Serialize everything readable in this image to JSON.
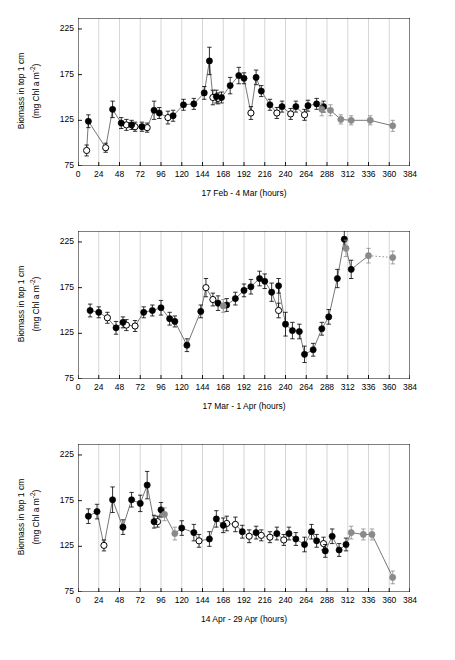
{
  "chart_data": [
    {
      "type": "scatter",
      "title": "",
      "xlabel": "17 Feb - 4 Mar  (hours)",
      "ylabel": "Biomass in top 1 cm (mg Chl a m-2)",
      "ylabel_line1": "Biomass in top 1 cm",
      "ylabel_line2": "(mg Chl a m",
      "ylabel_exp": "-2",
      "ylabel_line2_end": ")",
      "xlim": [
        0,
        384
      ],
      "ylim": [
        75,
        237
      ],
      "yticks": [
        75,
        125,
        175,
        225
      ],
      "xticks": [
        0,
        24,
        48,
        72,
        96,
        120,
        144,
        168,
        192,
        216,
        240,
        264,
        288,
        312,
        336,
        360,
        384
      ],
      "grid": "vertical",
      "series": [
        {
          "name": "open symbols (low tide / light)",
          "marker": "open-circle",
          "points": [
            {
              "x": 10,
              "y": 92,
              "err": 6
            },
            {
              "x": 32,
              "y": 95,
              "err": 5
            },
            {
              "x": 56,
              "y": 120,
              "err": 6
            },
            {
              "x": 66,
              "y": 118,
              "err": 5
            },
            {
              "x": 80,
              "y": 117,
              "err": 5
            },
            {
              "x": 104,
              "y": 128,
              "err": 7
            },
            {
              "x": 156,
              "y": 150,
              "err": 8
            },
            {
              "x": 162,
              "y": 149,
              "err": 6
            },
            {
              "x": 200,
              "y": 133,
              "err": 7
            },
            {
              "x": 230,
              "y": 133,
              "err": 6
            },
            {
              "x": 246,
              "y": 132,
              "err": 6
            },
            {
              "x": 262,
              "y": 131,
              "err": 6
            }
          ]
        },
        {
          "name": "filled black symbols (high tide / dark)",
          "marker": "filled-circle",
          "points": [
            {
              "x": 12,
              "y": 124,
              "err": 7
            },
            {
              "x": 40,
              "y": 137,
              "err": 9
            },
            {
              "x": 50,
              "y": 122,
              "err": 6
            },
            {
              "x": 62,
              "y": 120,
              "err": 5
            },
            {
              "x": 74,
              "y": 118,
              "err": 5
            },
            {
              "x": 88,
              "y": 136,
              "err": 10
            },
            {
              "x": 94,
              "y": 133,
              "err": 6
            },
            {
              "x": 110,
              "y": 130,
              "err": 6
            },
            {
              "x": 122,
              "y": 142,
              "err": 6
            },
            {
              "x": 134,
              "y": 143,
              "err": 6
            },
            {
              "x": 146,
              "y": 155,
              "err": 7
            },
            {
              "x": 152,
              "y": 190,
              "err": 15
            },
            {
              "x": 160,
              "y": 151,
              "err": 7
            },
            {
              "x": 166,
              "y": 150,
              "err": 6
            },
            {
              "x": 176,
              "y": 163,
              "err": 9
            },
            {
              "x": 186,
              "y": 174,
              "err": 9
            },
            {
              "x": 192,
              "y": 171,
              "err": 6
            },
            {
              "x": 206,
              "y": 172,
              "err": 8
            },
            {
              "x": 212,
              "y": 157,
              "err": 6
            },
            {
              "x": 222,
              "y": 142,
              "err": 6
            },
            {
              "x": 236,
              "y": 140,
              "err": 6
            },
            {
              "x": 252,
              "y": 140,
              "err": 6
            },
            {
              "x": 266,
              "y": 141,
              "err": 6
            },
            {
              "x": 276,
              "y": 143,
              "err": 6
            },
            {
              "x": 284,
              "y": 140,
              "err": 6
            }
          ]
        },
        {
          "name": "grey symbols",
          "marker": "filled-grey-circle",
          "points": [
            {
              "x": 282,
              "y": 137,
              "err": 7
            },
            {
              "x": 292,
              "y": 136,
              "err": 6
            },
            {
              "x": 304,
              "y": 126,
              "err": 5
            },
            {
              "x": 316,
              "y": 125,
              "err": 5
            },
            {
              "x": 338,
              "y": 125,
              "err": 5
            },
            {
              "x": 364,
              "y": 119,
              "err": 6
            }
          ]
        }
      ]
    },
    {
      "type": "scatter",
      "title": "",
      "xlabel": "17 Mar - 1 Apr  (hours)",
      "ylabel_line1": "Biomass in top 1 cm",
      "ylabel_line2": "(mg Chl a m",
      "ylabel_exp": "-2",
      "ylabel_line2_end": ")",
      "xlim": [
        0,
        384
      ],
      "ylim": [
        75,
        237
      ],
      "yticks": [
        75,
        125,
        175,
        225
      ],
      "xticks": [
        0,
        24,
        48,
        72,
        96,
        120,
        144,
        168,
        192,
        216,
        240,
        264,
        288,
        312,
        336,
        360,
        384
      ],
      "grid": "vertical",
      "series": [
        {
          "name": "open symbols",
          "marker": "open-circle",
          "points": [
            {
              "x": 34,
              "y": 142,
              "err": 6
            },
            {
              "x": 56,
              "y": 134,
              "err": 6
            },
            {
              "x": 66,
              "y": 133,
              "err": 6
            },
            {
              "x": 148,
              "y": 175,
              "err": 10
            },
            {
              "x": 156,
              "y": 162,
              "err": 7
            },
            {
              "x": 232,
              "y": 150,
              "err": 8
            }
          ]
        },
        {
          "name": "filled black symbols",
          "marker": "filled-circle",
          "points": [
            {
              "x": 14,
              "y": 150,
              "err": 7
            },
            {
              "x": 24,
              "y": 148,
              "err": 6
            },
            {
              "x": 44,
              "y": 131,
              "err": 7
            },
            {
              "x": 52,
              "y": 137,
              "err": 6
            },
            {
              "x": 76,
              "y": 148,
              "err": 6
            },
            {
              "x": 86,
              "y": 150,
              "err": 6
            },
            {
              "x": 96,
              "y": 153,
              "err": 8
            },
            {
              "x": 106,
              "y": 141,
              "err": 7
            },
            {
              "x": 112,
              "y": 138,
              "err": 6
            },
            {
              "x": 126,
              "y": 112,
              "err": 7
            },
            {
              "x": 142,
              "y": 149,
              "err": 7
            },
            {
              "x": 162,
              "y": 158,
              "err": 8
            },
            {
              "x": 172,
              "y": 156,
              "err": 7
            },
            {
              "x": 182,
              "y": 163,
              "err": 7
            },
            {
              "x": 192,
              "y": 172,
              "err": 7
            },
            {
              "x": 200,
              "y": 176,
              "err": 8
            },
            {
              "x": 210,
              "y": 185,
              "err": 8
            },
            {
              "x": 216,
              "y": 182,
              "err": 8
            },
            {
              "x": 224,
              "y": 170,
              "err": 10
            },
            {
              "x": 232,
              "y": 177,
              "err": 8
            },
            {
              "x": 240,
              "y": 135,
              "err": 13
            },
            {
              "x": 248,
              "y": 128,
              "err": 9
            },
            {
              "x": 256,
              "y": 127,
              "err": 8
            },
            {
              "x": 262,
              "y": 102,
              "err": 9
            },
            {
              "x": 272,
              "y": 107,
              "err": 7
            },
            {
              "x": 282,
              "y": 130,
              "err": 7
            },
            {
              "x": 290,
              "y": 143,
              "err": 8
            },
            {
              "x": 300,
              "y": 185,
              "err": 10
            },
            {
              "x": 308,
              "y": 228,
              "err": 10
            },
            {
              "x": 316,
              "y": 195,
              "err": 10
            }
          ]
        },
        {
          "name": "grey symbols",
          "marker": "filled-grey-circle",
          "points": [
            {
              "x": 168,
              "y": 155,
              "err": 7
            },
            {
              "x": 310,
              "y": 218,
              "err": 9
            },
            {
              "x": 336,
              "y": 210,
              "err": 8
            },
            {
              "x": 364,
              "y": 208,
              "err": 7
            }
          ]
        }
      ]
    },
    {
      "type": "scatter",
      "title": "",
      "xlabel": "14 Apr - 29 Apr  (hours)",
      "ylabel_line1": "Biomass in top 1 cm",
      "ylabel_line2": "(mg Chl a m",
      "ylabel_exp": "-2",
      "ylabel_line2_end": ")",
      "xlim": [
        0,
        384
      ],
      "ylim": [
        75,
        237
      ],
      "yticks": [
        75,
        125,
        175,
        225
      ],
      "xticks": [
        0,
        24,
        48,
        72,
        96,
        120,
        144,
        168,
        192,
        216,
        240,
        264,
        288,
        312,
        336,
        360,
        384
      ],
      "grid": "vertical",
      "series": [
        {
          "name": "open symbols",
          "marker": "open-circle",
          "points": [
            {
              "x": 30,
              "y": 126,
              "err": 6
            },
            {
              "x": 92,
              "y": 152,
              "err": 6
            },
            {
              "x": 140,
              "y": 131,
              "err": 7
            },
            {
              "x": 172,
              "y": 150,
              "err": 8
            },
            {
              "x": 182,
              "y": 149,
              "err": 8
            },
            {
              "x": 198,
              "y": 136,
              "err": 7
            },
            {
              "x": 212,
              "y": 137,
              "err": 6
            },
            {
              "x": 222,
              "y": 135,
              "err": 6
            },
            {
              "x": 238,
              "y": 132,
              "err": 6
            },
            {
              "x": 284,
              "y": 128,
              "err": 7
            }
          ]
        },
        {
          "name": "filled black symbols",
          "marker": "filled-circle",
          "points": [
            {
              "x": 12,
              "y": 158,
              "err": 8
            },
            {
              "x": 22,
              "y": 163,
              "err": 8
            },
            {
              "x": 40,
              "y": 176,
              "err": 14
            },
            {
              "x": 52,
              "y": 146,
              "err": 8
            },
            {
              "x": 62,
              "y": 176,
              "err": 8
            },
            {
              "x": 72,
              "y": 172,
              "err": 9
            },
            {
              "x": 80,
              "y": 192,
              "err": 15
            },
            {
              "x": 88,
              "y": 152,
              "err": 7
            },
            {
              "x": 96,
              "y": 165,
              "err": 8
            },
            {
              "x": 120,
              "y": 145,
              "err": 8
            },
            {
              "x": 134,
              "y": 140,
              "err": 9
            },
            {
              "x": 152,
              "y": 133,
              "err": 8
            },
            {
              "x": 160,
              "y": 155,
              "err": 9
            },
            {
              "x": 168,
              "y": 148,
              "err": 8
            },
            {
              "x": 190,
              "y": 141,
              "err": 7
            },
            {
              "x": 206,
              "y": 140,
              "err": 7
            },
            {
              "x": 230,
              "y": 139,
              "err": 7
            },
            {
              "x": 244,
              "y": 139,
              "err": 7
            },
            {
              "x": 252,
              "y": 133,
              "err": 7
            },
            {
              "x": 262,
              "y": 127,
              "err": 8
            },
            {
              "x": 270,
              "y": 141,
              "err": 8
            },
            {
              "x": 276,
              "y": 131,
              "err": 7
            },
            {
              "x": 286,
              "y": 120,
              "err": 7
            },
            {
              "x": 294,
              "y": 136,
              "err": 8
            },
            {
              "x": 302,
              "y": 121,
              "err": 7
            },
            {
              "x": 310,
              "y": 127,
              "err": 7
            }
          ]
        },
        {
          "name": "grey symbols",
          "marker": "filled-grey-circle",
          "points": [
            {
              "x": 100,
              "y": 160,
              "err": 7
            },
            {
              "x": 112,
              "y": 139,
              "err": 7
            },
            {
              "x": 316,
              "y": 140,
              "err": 7
            },
            {
              "x": 330,
              "y": 138,
              "err": 6
            },
            {
              "x": 340,
              "y": 138,
              "err": 6
            },
            {
              "x": 364,
              "y": 91,
              "err": 7
            }
          ]
        }
      ]
    }
  ]
}
